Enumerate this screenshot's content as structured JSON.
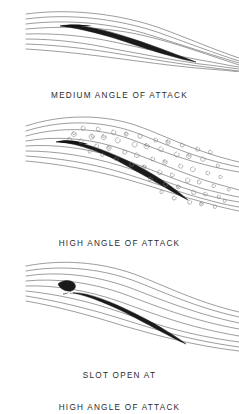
{
  "figure": {
    "background_color": "#ffffff",
    "ink_color": "#1a1a1a",
    "streamline_color": "#5a5a5a",
    "eddy_color": "#7a7a7a",
    "caption_color": "#2b2b2b"
  },
  "panels": [
    {
      "id": "medium-angle-of-attack",
      "caption_lines": [
        "MEDIUM ANGLE OF ATTACK"
      ],
      "flow_state": "attached",
      "streamline_count": 8,
      "eddy_count": 0,
      "has_slat": false,
      "airfoil": {
        "chord_angle_deg": 14,
        "leading_edge_x": 60,
        "leading_edge_y": 26,
        "trailing_edge_x": 196,
        "trailing_edge_y": 62
      }
    },
    {
      "id": "high-angle-of-attack",
      "caption_lines": [
        "HIGH ANGLE OF ATTACK"
      ],
      "flow_state": "separated-turbulent",
      "streamline_count": 8,
      "eddy_count": 58,
      "has_slat": false,
      "airfoil": {
        "chord_angle_deg": 24,
        "leading_edge_x": 56,
        "leading_edge_y": 42,
        "trailing_edge_x": 188,
        "trailing_edge_y": 100
      }
    },
    {
      "id": "slot-open-at-high-angle-of-attack",
      "caption_lines": [
        "SLOT OPEN AT",
        "HIGH ANGLE OF ATTACK"
      ],
      "flow_state": "attached-with-slot",
      "streamline_count": 8,
      "eddy_count": 0,
      "has_slat": true,
      "slat": {
        "label": "leading-edge-slat",
        "x": 62,
        "y": 36
      },
      "airfoil": {
        "chord_angle_deg": 26,
        "leading_edge_x": 70,
        "leading_edge_y": 44,
        "trailing_edge_x": 186,
        "trailing_edge_y": 96
      }
    }
  ]
}
